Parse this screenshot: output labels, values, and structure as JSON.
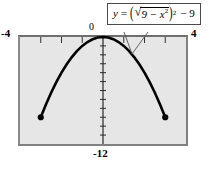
{
  "figure": {
    "name": "graphing-calculator-figure",
    "background_color": "#ffffff",
    "plot_background_color": "#e6e6e6",
    "frame_color": "#808080",
    "curve_color": "#000000"
  },
  "equation": {
    "y_var": "y",
    "equals": "=",
    "open_paren": "(",
    "radical_sign": "√",
    "radicand": "9 − x",
    "radicand_exponent": "2",
    "close_paren": ")",
    "paren_exponent": "2",
    "trailing": "− 9",
    "plain_text": "y = (√(9 − x²))² − 9"
  },
  "axis_labels": {
    "x_min": "-4",
    "x_max": "4",
    "y_max": "0",
    "y_min": "-12"
  },
  "chart_data": {
    "type": "line",
    "title": "",
    "subtitle": "",
    "xlabel": "",
    "ylabel": "",
    "xlim": [
      -4,
      4
    ],
    "ylim": [
      -12,
      0
    ],
    "grid": false,
    "legend": "none",
    "annotations": [
      {
        "text": "y = (√(9 − x²))² − 9",
        "points_to_x": 1.9,
        "points_to_y": -3.6
      }
    ],
    "xticks": [
      -4,
      -3,
      -2,
      -1,
      0,
      1,
      2,
      3,
      4
    ],
    "xtick_labels": [
      "-4",
      "",
      "",
      "",
      "0",
      "",
      "",
      "",
      "4"
    ],
    "yticks": [
      -12,
      -11,
      -10,
      -9,
      -8,
      -7,
      -6,
      -5,
      -4,
      -3,
      -2,
      -1,
      0
    ],
    "ytick_labels": [
      "-12",
      "",
      "",
      "",
      "",
      "",
      "",
      "",
      "",
      "",
      "",
      "",
      "0"
    ],
    "series": [
      {
        "name": "y = (sqrt(9 - x^2))^2 - 9",
        "domain": [
          -3,
          3
        ],
        "x": [
          -3,
          -2.75,
          -2.5,
          -2.25,
          -2,
          -1.75,
          -1.5,
          -1.25,
          -1,
          -0.75,
          -0.5,
          -0.25,
          0,
          0.25,
          0.5,
          0.75,
          1,
          1.25,
          1.5,
          1.75,
          2,
          2.25,
          2.5,
          2.75,
          3
        ],
        "y": [
          -9,
          -7.5625,
          -6.25,
          -5.0625,
          -4,
          -3.0625,
          -2.25,
          -1.5625,
          -1,
          -0.5625,
          -0.25,
          -0.0625,
          0,
          -0.0625,
          -0.25,
          -0.5625,
          -1,
          -1.5625,
          -2.25,
          -3.0625,
          -4,
          -5.0625,
          -6.25,
          -7.5625,
          -9
        ]
      }
    ],
    "endpoints": [
      {
        "x": -3,
        "y": -9,
        "style": "filled-dot"
      },
      {
        "x": 3,
        "y": -9,
        "style": "filled-dot"
      }
    ]
  }
}
